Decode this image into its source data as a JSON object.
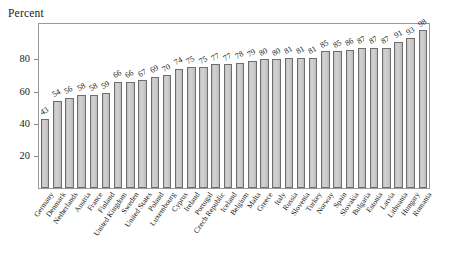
{
  "chart_data": {
    "type": "bar",
    "title": "",
    "ylabel": "Percent",
    "xlabel": "",
    "ylim": [
      0,
      100
    ],
    "yticks": [
      20,
      40,
      60,
      80
    ],
    "grid": false,
    "legend": null,
    "bar_color": "#c9c9c9",
    "bar_edge_color": "#6e6e6e",
    "categories": [
      "Germany",
      "Denmark",
      "Netherlands",
      "Austria",
      "France",
      "Finland",
      "United Kingdom",
      "Sweden",
      "United States",
      "Poland",
      "Luxembourg",
      "Cyprus",
      "Ireland",
      "Portugal",
      "Czech Republic",
      "Iceland",
      "Belgium",
      "Malta",
      "Greece",
      "Italy",
      "Russia",
      "Slovenia",
      "Turkey",
      "Norway",
      "Spain",
      "Slovakia",
      "Bulgaria",
      "Estonia",
      "Latvia",
      "Lithuania",
      "Hungary",
      "Romania"
    ],
    "values": [
      43,
      54,
      56,
      58,
      58,
      59,
      66,
      66,
      67,
      69,
      70,
      74,
      75,
      75,
      77,
      77,
      78,
      79,
      80,
      80,
      81,
      81,
      81,
      85,
      85,
      86,
      87,
      87,
      87,
      91,
      93,
      98
    ]
  }
}
